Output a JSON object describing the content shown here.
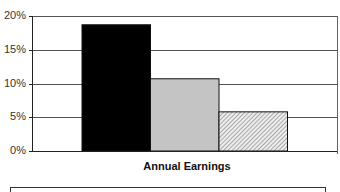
{
  "chart_data": {
    "type": "bar",
    "title": "",
    "xlabel": "Annual Earnings",
    "ylabel": "",
    "categories": [
      "Annual Earnings"
    ],
    "series": [
      {
        "name": "Series 1",
        "values": [
          18.7
        ],
        "fill": "#000000",
        "pattern": "solid"
      },
      {
        "name": "Series 2",
        "values": [
          10.7
        ],
        "fill": "#c4c4c4",
        "pattern": "solid"
      },
      {
        "name": "Series 3",
        "values": [
          5.8
        ],
        "fill": "#dcdcdc",
        "pattern": "diagonal-hatch"
      }
    ],
    "ylim": [
      0,
      20
    ],
    "yticks": [
      0,
      5,
      10,
      15,
      20
    ],
    "ytick_labels": [
      "0%",
      "5%",
      "10%",
      "15%",
      "20%"
    ],
    "grid": true,
    "legend_position": "bottom",
    "value_format": "percent"
  },
  "axis": {
    "title": "Annual Earnings",
    "tick_labels": [
      "20%",
      "15%",
      "10%",
      "5%",
      "0%"
    ]
  }
}
